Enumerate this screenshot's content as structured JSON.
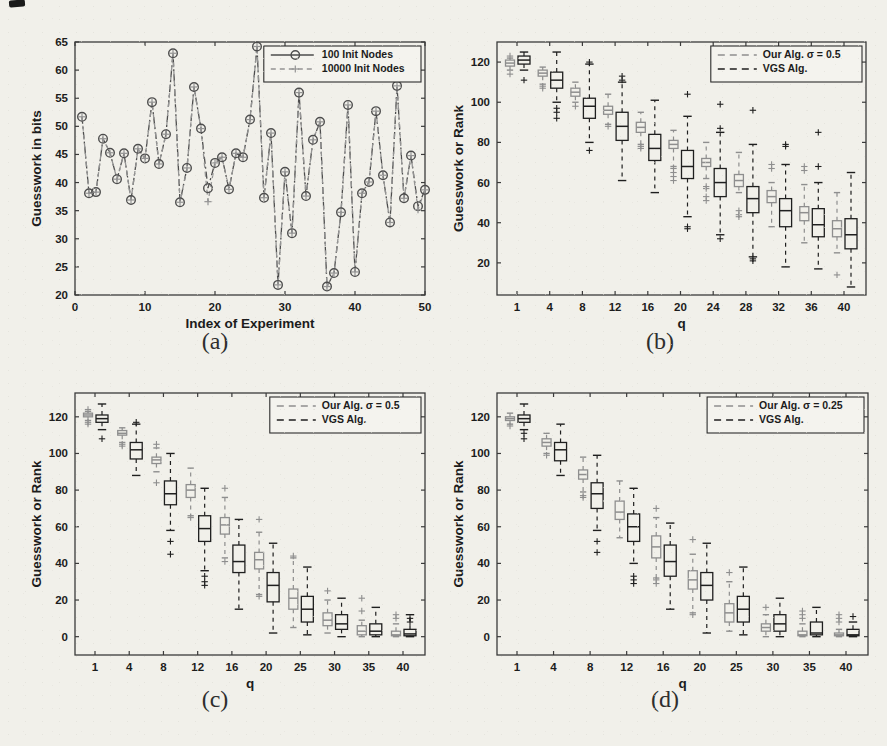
{
  "captions": {
    "a": "(a)",
    "b": "(b)",
    "c": "(c)",
    "d": "(d)"
  },
  "style": {
    "paper_bg": "#f1f0ea",
    "axis_color": "#3b3b3b",
    "text_color": "#1c1c1c",
    "legend_bg": "#f4f3ee",
    "our_color": "#8e8e8e",
    "vgs_color": "#1f1f1f",
    "line1_color": "#4d4d4d",
    "line2_color": "#949494"
  },
  "chart_data": [
    {
      "id": "a",
      "type": "line",
      "xlabel": "Index of Experiment",
      "ylabel": "Guesswork in bits",
      "xlim": [
        0,
        50
      ],
      "ylim": [
        20,
        65
      ],
      "xticks": [
        0,
        10,
        20,
        30,
        40,
        50
      ],
      "yticks": [
        20,
        25,
        30,
        35,
        40,
        45,
        50,
        55,
        60,
        65
      ],
      "legend_position": "top-right",
      "series": [
        {
          "name": "100 Init Nodes",
          "marker": "circle",
          "line_style": "dashdot",
          "x_start": 1,
          "values": [
            51.7,
            38.1,
            38.3,
            47.8,
            45.3,
            40.6,
            45.2,
            36.9,
            46.0,
            44.3,
            54.3,
            43.3,
            48.6,
            63.0,
            36.5,
            42.6,
            57.0,
            49.6,
            39.0,
            43.5,
            44.5,
            38.8,
            45.2,
            44.5,
            51.2,
            64.2,
            37.3,
            48.8,
            21.8,
            41.9,
            31.0,
            56.0,
            37.6,
            47.6,
            50.8,
            21.5,
            23.9,
            34.7,
            53.8,
            24.1,
            38.1,
            40.1,
            52.7,
            41.3,
            32.9,
            57.2,
            37.2,
            44.8,
            35.8,
            38.7
          ]
        },
        {
          "name": "10000 Init Nodes",
          "marker": "plus",
          "line_style": "dash",
          "x_start": 1,
          "values": [
            51.7,
            38.1,
            38.3,
            47.8,
            45.3,
            40.6,
            45.2,
            36.9,
            46.0,
            44.3,
            54.3,
            43.3,
            48.6,
            63.0,
            36.5,
            42.6,
            57.0,
            49.6,
            36.6,
            43.5,
            44.5,
            38.8,
            45.2,
            44.5,
            51.2,
            64.2,
            37.3,
            48.8,
            21.8,
            41.9,
            31.0,
            56.0,
            37.6,
            47.6,
            50.8,
            21.5,
            23.9,
            34.7,
            53.8,
            24.1,
            38.1,
            40.1,
            52.7,
            41.3,
            32.9,
            57.2,
            37.2,
            44.8,
            35.2,
            38.7
          ]
        }
      ]
    },
    {
      "id": "b",
      "type": "box",
      "xlabel": "q",
      "ylabel": "Guesswork or Rank",
      "categories": [
        1,
        4,
        8,
        12,
        16,
        20,
        24,
        28,
        32,
        36,
        40
      ],
      "ylim": [
        4,
        130
      ],
      "yticks": [
        20,
        40,
        60,
        80,
        100,
        120
      ],
      "legend_position": "top-right",
      "series": [
        {
          "name": "Our Alg. σ = 0.5",
          "role": "our",
          "boxes": [
            [
              116,
              118,
              119.5,
              121,
              122
            ],
            [
              109,
              113,
              114.5,
              116,
              117.5
            ],
            [
              100,
              103,
              105,
              107,
              110
            ],
            [
              89,
              94,
              96,
              98,
              104
            ],
            [
              79,
              85,
              87.5,
              90,
              95
            ],
            [
              68,
              77,
              79,
              81,
              86
            ],
            [
              62,
              68,
              70,
              72,
              80
            ],
            [
              55,
              58,
              61,
              64,
              75
            ],
            [
              38,
              50,
              53,
              56,
              60
            ],
            [
              30,
              41,
              45,
              48,
              59
            ],
            [
              25,
              33,
              37,
              41,
              55
            ]
          ],
          "outliers": [
            [
              114,
              123
            ],
            [
              107,
              108
            ],
            [
              98
            ],
            [
              88
            ],
            [
              77,
              78
            ],
            [
              61,
              63,
              65,
              67
            ],
            [
              51,
              53,
              57,
              58
            ],
            [
              43,
              44,
              46
            ],
            [
              67,
              69
            ],
            [
              66,
              68
            ],
            [
              14
            ]
          ]
        },
        {
          "name": "VGS Alg.",
          "role": "vgs",
          "boxes": [
            [
              116,
              119,
              121,
              123,
              125
            ],
            [
              100,
              107,
              111,
              115,
              125
            ],
            [
              80,
              92,
              98,
              102,
              119
            ],
            [
              61,
              81,
              88,
              95,
              110
            ],
            [
              55,
              71,
              77,
              84,
              101
            ],
            [
              43,
              62,
              68,
              76,
              93
            ],
            [
              34,
              53,
              60,
              67,
              85
            ],
            [
              23,
              45,
              52,
              58,
              79
            ],
            [
              18,
              38,
              46,
              52,
              69
            ],
            [
              17,
              33,
              39,
              47,
              60
            ],
            [
              8,
              27,
              34,
              42,
              65
            ]
          ],
          "outliers": [
            [
              111
            ],
            [
              92,
              95,
              97
            ],
            [
              76,
              120
            ],
            [
              111,
              113
            ],
            [],
            [
              37,
              38,
              104
            ],
            [
              32,
              87,
              99
            ],
            [
              21,
              22,
              96
            ],
            [
              78,
              79
            ],
            [
              68,
              85
            ],
            []
          ]
        }
      ]
    },
    {
      "id": "c",
      "type": "box",
      "xlabel": "q",
      "ylabel": "Guesswork or Rank",
      "categories": [
        1,
        4,
        8,
        12,
        16,
        20,
        25,
        30,
        35,
        40
      ],
      "ylim": [
        -10,
        133
      ],
      "yticks": [
        0,
        20,
        40,
        60,
        80,
        100,
        120
      ],
      "legend_position": "top-right",
      "series": [
        {
          "name": "Our Alg. σ = 0.5",
          "role": "our",
          "boxes": [
            [
              118,
              120,
              121,
              122,
              123
            ],
            [
              106,
              110,
              111,
              112.5,
              114
            ],
            [
              90,
              94.5,
              96.5,
              98,
              103
            ],
            [
              66,
              76,
              80,
              83,
              92
            ],
            [
              43,
              56,
              61,
              65,
              76
            ],
            [
              23,
              37,
              42,
              46,
              57
            ],
            [
              5,
              15,
              21,
              26,
              43
            ],
            [
              2,
              6,
              9,
              13,
              20
            ],
            [
              0,
              1,
              3,
              6,
              9
            ],
            [
              0,
              0.5,
              1,
              3,
              7
            ]
          ],
          "outliers": [
            [
              116,
              117,
              124
            ],
            [
              104,
              105
            ],
            [
              84,
              105
            ],
            [
              65
            ],
            [
              41,
              81
            ],
            [
              22,
              64
            ],
            [
              44
            ],
            [
              25
            ],
            [
              14,
              21
            ],
            [
              10,
              12
            ]
          ]
        },
        {
          "name": "VGS Alg.",
          "role": "vgs",
          "boxes": [
            [
              113,
              117,
              119,
              121,
              127
            ],
            [
              88,
              97,
              102,
              106,
              116
            ],
            [
              58,
              72,
              78,
              85,
              100
            ],
            [
              36,
              52,
              59,
              66,
              81
            ],
            [
              15,
              35,
              41,
              50,
              64
            ],
            [
              2,
              19,
              28,
              35,
              51
            ],
            [
              1,
              8,
              15,
              22,
              38
            ],
            [
              0,
              4,
              7,
              12,
              21
            ],
            [
              0,
              1,
              3,
              7,
              16
            ],
            [
              0,
              0.5,
              1.5,
              4,
              12
            ]
          ],
          "outliers": [
            [
              108
            ],
            [
              117
            ],
            [
              45,
              52
            ],
            [
              28,
              30,
              33
            ],
            [],
            [],
            [],
            [],
            [],
            [
              8,
              10
            ]
          ]
        }
      ]
    },
    {
      "id": "d",
      "type": "box",
      "xlabel": "q",
      "ylabel": "Guesswork or Rank",
      "categories": [
        1,
        4,
        8,
        12,
        16,
        20,
        25,
        30,
        35,
        40
      ],
      "ylim": [
        -10,
        133
      ],
      "yticks": [
        0,
        20,
        40,
        60,
        80,
        100,
        120
      ],
      "legend_position": "top-right",
      "series": [
        {
          "name": "Our Alg. σ = 0.25",
          "role": "our",
          "boxes": [
            [
              116,
              118,
              119,
              120,
              122
            ],
            [
              100,
              104,
              106,
              108,
              111
            ],
            [
              79,
              86,
              88.5,
              91,
              98
            ],
            [
              54,
              64,
              68,
              74,
              85
            ],
            [
              32,
              43,
              49,
              55,
              65
            ],
            [
              13,
              26,
              31,
              36,
              45
            ],
            [
              3,
              8,
              13,
              18,
              30
            ],
            [
              0,
              3,
              5,
              7,
              12
            ],
            [
              0,
              0.5,
              1,
              3,
              7
            ],
            [
              0,
              0.5,
              1,
              2,
              4
            ]
          ],
          "outliers": [
            [
              115
            ],
            [
              99
            ],
            [
              76,
              77
            ],
            [],
            [
              29,
              31,
              70
            ],
            [
              12,
              53
            ],
            [
              35
            ],
            [
              16
            ],
            [
              10,
              12,
              14
            ],
            [
              8,
              10,
              12
            ]
          ]
        },
        {
          "name": "VGS Alg.",
          "role": "vgs",
          "boxes": [
            [
              113,
              117,
              119,
              121,
              127
            ],
            [
              88,
              96,
              102,
              106,
              116
            ],
            [
              58,
              70,
              78,
              84,
              99
            ],
            [
              40,
              52,
              60,
              67,
              81
            ],
            [
              15,
              33,
              41,
              50,
              62
            ],
            [
              2,
              20,
              28,
              35,
              51
            ],
            [
              1,
              8,
              15,
              22,
              38
            ],
            [
              0,
              3,
              7,
              12,
              21
            ],
            [
              0,
              1,
              2,
              8,
              16
            ],
            [
              0,
              0.5,
              1,
              4,
              8
            ]
          ],
          "outliers": [
            [
              108,
              111
            ],
            [],
            [
              46,
              52
            ],
            [
              29,
              31,
              33
            ],
            [],
            [],
            [],
            [],
            [],
            [
              11
            ]
          ]
        }
      ]
    }
  ]
}
